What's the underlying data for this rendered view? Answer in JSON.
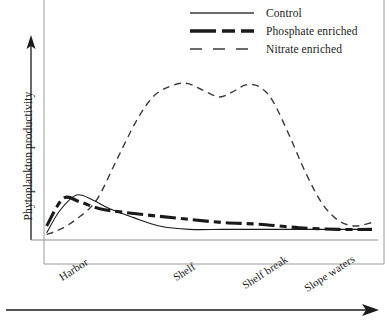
{
  "chart_data": {
    "type": "line",
    "title": "",
    "xlabel": "",
    "ylabel": "Phytoplankton productivity",
    "xlim": [
      0,
      100
    ],
    "ylim": [
      0,
      100
    ],
    "grid": false,
    "axes_style": "arrow-axes, no numeric ticks",
    "legend_position": "top-right",
    "categories": [
      "Harbor",
      "Shelf",
      "Shelf break",
      "Slope waters"
    ],
    "category_positions": [
      10,
      48,
      70,
      87
    ],
    "series": [
      {
        "name": "Control",
        "line_style": "solid",
        "line_width": 1,
        "color": "#1a1a1a",
        "x": [
          2,
          6,
          11,
          16,
          21,
          28,
          36,
          45,
          55,
          66,
          78,
          90,
          100
        ],
        "values": [
          3,
          16,
          25,
          22,
          17,
          12,
          7,
          5,
          5,
          5,
          5,
          5,
          5
        ]
      },
      {
        "name": "Phosphate enriched",
        "line_style": "dash-dot-thick",
        "line_width": 3,
        "color": "#1a1a1a",
        "x": [
          2,
          7,
          12,
          18,
          25,
          34,
          44,
          55,
          66,
          78,
          90,
          100
        ],
        "values": [
          7,
          23,
          21,
          17,
          15,
          13,
          11,
          9,
          8,
          6,
          5,
          5
        ]
      },
      {
        "name": "Nitrate enriched",
        "line_style": "dashed",
        "line_width": 1.3,
        "color": "#3a3a3a",
        "x": [
          2,
          6,
          11,
          17,
          23,
          29,
          34,
          39,
          44,
          49,
          54,
          58,
          62,
          66,
          70,
          75,
          80,
          85,
          90,
          95,
          100
        ],
        "values": [
          2,
          5,
          11,
          22,
          45,
          68,
          82,
          88,
          90,
          86,
          82,
          85,
          89,
          88,
          80,
          60,
          38,
          20,
          10,
          7,
          9
        ]
      }
    ]
  },
  "legend": {
    "items": [
      {
        "label": "Control",
        "key": "solid-thin"
      },
      {
        "label": "Phosphate enriched",
        "key": "dash-dot-thick"
      },
      {
        "label": "Nitrate enriched",
        "key": "dashed-thin"
      }
    ]
  },
  "axes": {
    "y_title": "Phytoplankton productivity",
    "x_tick_labels": [
      "Harbor",
      "Shelf",
      "Shelf break",
      "Slope waters"
    ]
  },
  "colors": {
    "ink": "#1a1a1a",
    "nitrate": "#3a3a3a",
    "frame": "#8a8a8a",
    "background": "#ffffff"
  }
}
